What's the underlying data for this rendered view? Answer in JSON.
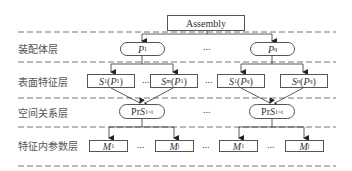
{
  "diagram": {
    "root": {
      "label": "Assembly"
    },
    "layers": [
      {
        "label": "装配体层"
      },
      {
        "label": "表面特征层"
      },
      {
        "label": "空间关系层"
      },
      {
        "label": "特征内参数层"
      }
    ],
    "assembly_layer": {
      "parts": [
        {
          "var": "P",
          "sub": "1"
        },
        {
          "var": "P",
          "sub": "q"
        }
      ],
      "ellipsis": "..."
    },
    "surface_layer": {
      "left": [
        {
          "fn": "S",
          "fn_sub": "1",
          "arg": "P",
          "arg_sub": "1"
        },
        {
          "fn": "S",
          "fn_sub": "m",
          "arg": "P",
          "arg_sub": "1"
        }
      ],
      "right": [
        {
          "fn": "S",
          "fn_sub": "1",
          "arg": "P",
          "arg_sub": "q"
        },
        {
          "fn": "S",
          "fn_sub": "n",
          "arg": "P",
          "arg_sub": "q"
        }
      ],
      "ellipsis": "..."
    },
    "spatial_layer": {
      "nodes": [
        {
          "prefix": "Pr",
          "var": "S",
          "sub": "1~i"
        },
        {
          "prefix": "Pr",
          "var": "S",
          "sub": "1~i"
        }
      ],
      "ellipsis": "..."
    },
    "param_layer": {
      "left": [
        {
          "var": "M",
          "sub": "1"
        },
        {
          "var": "M",
          "sub": "j"
        }
      ],
      "right": [
        {
          "var": "M",
          "sub": "1"
        },
        {
          "var": "M",
          "sub": "j"
        }
      ],
      "ellipsis": "..."
    }
  }
}
